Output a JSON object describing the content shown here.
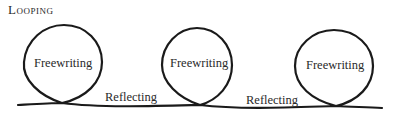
{
  "title": "Looping",
  "loops": [
    {
      "label": "Freewriting"
    },
    {
      "label": "Freewriting"
    },
    {
      "label": "Freewriting"
    }
  ],
  "connectors": [
    {
      "label": "Reflecting"
    },
    {
      "label": "Reflecting"
    }
  ],
  "colors": {
    "stroke": "#1a1a1a",
    "text": "#2a2a2a",
    "background": "#ffffff"
  }
}
